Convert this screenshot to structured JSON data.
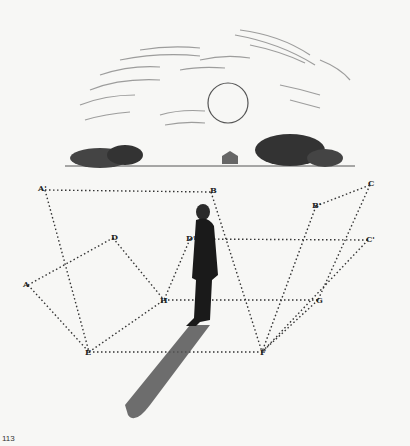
{
  "figure": {
    "page_number": "113",
    "points": [
      {
        "label": "A'",
        "x": 45,
        "y": 190
      },
      {
        "label": "B",
        "x": 211,
        "y": 192
      },
      {
        "label": "C",
        "x": 370,
        "y": 185
      },
      {
        "label": "B'",
        "x": 316,
        "y": 206
      },
      {
        "label": "D",
        "x": 113,
        "y": 238
      },
      {
        "label": "D'",
        "x": 190,
        "y": 239
      },
      {
        "label": "C'",
        "x": 368,
        "y": 240
      },
      {
        "label": "A",
        "x": 28,
        "y": 285
      },
      {
        "label": "H",
        "x": 164,
        "y": 300
      },
      {
        "label": "G",
        "x": 318,
        "y": 300
      },
      {
        "label": "E",
        "x": 89,
        "y": 352
      },
      {
        "label": "F",
        "x": 262,
        "y": 352
      }
    ],
    "colors": {
      "background": "#f7f7f5",
      "ink": "#222222"
    }
  }
}
